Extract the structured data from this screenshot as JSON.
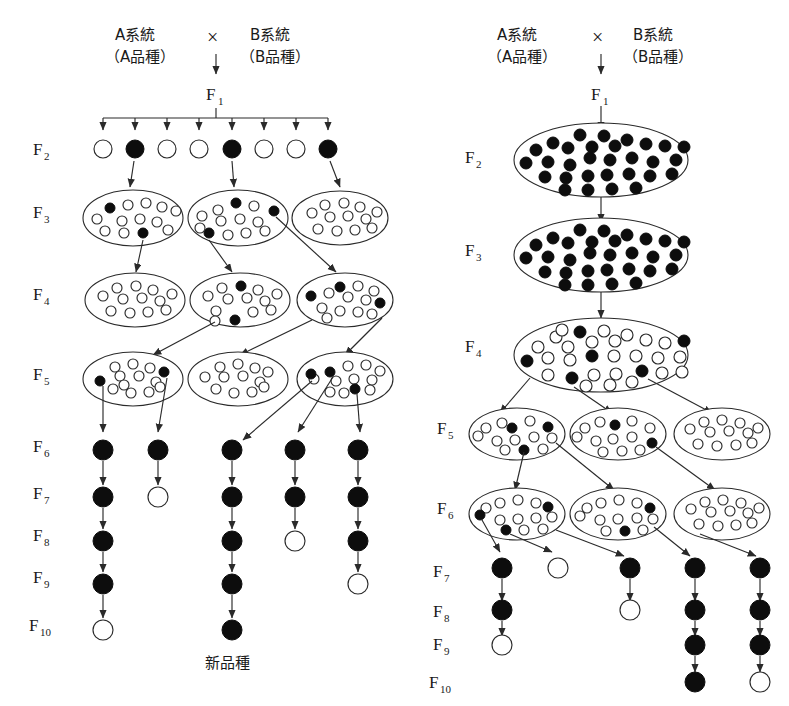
{
  "figure": {
    "title_jp_new_variety": "新品種",
    "cross_symbol": "×",
    "parent_a_line": "A系統",
    "parent_a_variety": "（A品種）",
    "parent_b_line": "B系統",
    "parent_b_variety": "（B品種）",
    "f1_label": "F",
    "f1_sub": "1"
  },
  "colors": {
    "ink": "#1a1a1a",
    "stroke": "#2a2a2a",
    "filled_plant": "#0d0d0d",
    "open_plant": "#ffffff",
    "background": "#ffffff"
  },
  "generation_labels": {
    "letter": "F",
    "left": [
      "2",
      "3",
      "4",
      "5",
      "6",
      "7",
      "8",
      "9",
      "10"
    ],
    "right": [
      "2",
      "3",
      "4",
      "5",
      "6",
      "7",
      "8",
      "9",
      "10"
    ]
  },
  "left_panel": {
    "name": "pedigree-method",
    "f1_to_f2_branches": 8,
    "f2_row": {
      "label_sub": "2",
      "plants": [
        "open",
        "filled",
        "open",
        "open",
        "filled",
        "open",
        "open",
        "filled"
      ],
      "selected_indices": [
        1,
        4,
        7
      ]
    },
    "f3_row": {
      "label_sub": "3",
      "populations": [
        {
          "filled": 2,
          "open": 11
        },
        {
          "filled": 3,
          "open": 10
        },
        {
          "filled": 0,
          "open": 12
        }
      ]
    },
    "f4_row": {
      "label_sub": "4",
      "populations": [
        {
          "filled": 0,
          "open": 12
        },
        {
          "filled": 2,
          "open": 11
        },
        {
          "filled": 3,
          "open": 10
        }
      ]
    },
    "f5_row": {
      "label_sub": "5",
      "populations": [
        {
          "filled": 2,
          "open": 11
        },
        {
          "filled": 0,
          "open": 12
        },
        {
          "filled": 3,
          "open": 11
        }
      ]
    },
    "lines": [
      {
        "id": "L1",
        "f6": "filled",
        "f7": "filled",
        "f8": "filled",
        "f9": "filled",
        "f10": "open"
      },
      {
        "id": "L2",
        "f6": "filled",
        "f7": "open",
        "f8": null,
        "f9": null,
        "f10": null
      },
      {
        "id": "L3",
        "f6": "filled",
        "f7": "filled",
        "f8": "filled",
        "f9": "filled",
        "f10": "filled"
      },
      {
        "id": "L4",
        "f6": "filled",
        "f7": "filled",
        "f8": "open",
        "f9": null,
        "f10": null
      },
      {
        "id": "L5",
        "f6": "filled",
        "f7": "filled",
        "f8": "filled",
        "f9": "open",
        "f10": null
      }
    ],
    "outcome_label": "新品種",
    "outcome_line_id": "L3"
  },
  "right_panel": {
    "name": "bulk-method",
    "f2_bulk": {
      "label_sub": "2",
      "filled": 30,
      "open": 0
    },
    "f3_bulk": {
      "label_sub": "3",
      "filled": 30,
      "open": 0
    },
    "f4_bulk": {
      "label_sub": "4",
      "filled": 6,
      "open": 26
    },
    "f5_row": {
      "label_sub": "5",
      "populations": [
        {
          "filled": 3,
          "open": 10
        },
        {
          "filled": 2,
          "open": 11
        },
        {
          "filled": 0,
          "open": 12
        }
      ]
    },
    "f6_row": {
      "label_sub": "6",
      "populations": [
        {
          "filled": 3,
          "open": 10
        },
        {
          "filled": 2,
          "open": 11
        },
        {
          "filled": 0,
          "open": 12
        }
      ]
    },
    "lines": [
      {
        "id": "R1",
        "f7": "filled",
        "f8": "filled",
        "f9": "open",
        "f10": null
      },
      {
        "id": "R2",
        "f7": "open",
        "f8": null,
        "f9": null,
        "f10": null
      },
      {
        "id": "R3",
        "f7": "filled",
        "f8": "open",
        "f9": null,
        "f10": null
      },
      {
        "id": "R4",
        "f7": "filled",
        "f8": "filled",
        "f9": "filled",
        "f10": "filled"
      },
      {
        "id": "R5",
        "f7": "filled",
        "f8": "filled",
        "f9": "filled",
        "f10": "open"
      }
    ]
  }
}
